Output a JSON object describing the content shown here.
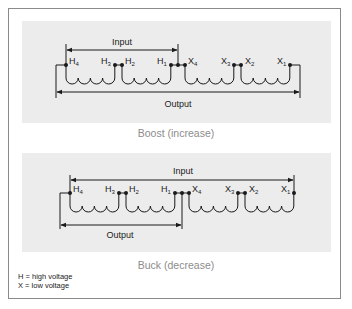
{
  "diagrams": [
    {
      "id": "boost",
      "caption": "Boost (increase)",
      "input_label": "Input",
      "output_label": "Output",
      "terminals": [
        {
          "letter": "H",
          "sub": "4"
        },
        {
          "letter": "H",
          "sub": "3"
        },
        {
          "letter": "H",
          "sub": "2"
        },
        {
          "letter": "H",
          "sub": "1"
        },
        {
          "letter": "X",
          "sub": "4"
        },
        {
          "letter": "X",
          "sub": "3"
        },
        {
          "letter": "X",
          "sub": "2"
        },
        {
          "letter": "X",
          "sub": "1"
        }
      ]
    },
    {
      "id": "buck",
      "caption": "Buck (decrease)",
      "input_label": "Input",
      "output_label": "Output",
      "terminals": [
        {
          "letter": "H",
          "sub": "4"
        },
        {
          "letter": "H",
          "sub": "3"
        },
        {
          "letter": "H",
          "sub": "2"
        },
        {
          "letter": "H",
          "sub": "1"
        },
        {
          "letter": "X",
          "sub": "4"
        },
        {
          "letter": "X",
          "sub": "3"
        },
        {
          "letter": "X",
          "sub": "2"
        },
        {
          "letter": "X",
          "sub": "1"
        }
      ]
    }
  ],
  "legend": {
    "h": "H = high voltage",
    "x": "X = low voltage"
  },
  "colors": {
    "line": "#1a1a1a",
    "panel": "#ececec",
    "caption": "#8c8c8c",
    "frame": "#8a8a8a"
  }
}
